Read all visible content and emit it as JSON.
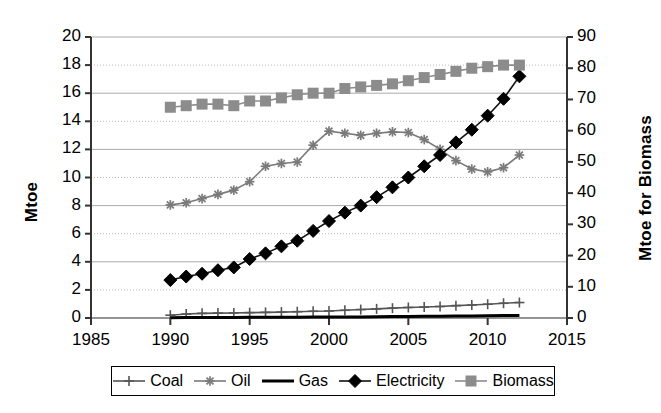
{
  "chart_data": {
    "type": "line",
    "title": "",
    "xlabel": "",
    "ylabel": "Mtoe",
    "ylabel_secondary": "Mtoe for Biomass",
    "xlim": [
      1985,
      2015
    ],
    "ylim": [
      0,
      20
    ],
    "ylim_secondary": [
      0,
      90
    ],
    "grid": true,
    "grid_style": "alternating solid and dotted horizontal gridlines",
    "legend_position": "bottom",
    "x_ticks": [
      "1985",
      "1990",
      "1995",
      "2000",
      "2005",
      "2010",
      "2015"
    ],
    "y_ticks_left": [
      "0",
      "2",
      "4",
      "6",
      "8",
      "10",
      "12",
      "14",
      "16",
      "18",
      "20"
    ],
    "y_ticks_right": [
      "0",
      "10",
      "20",
      "30",
      "40",
      "50",
      "60",
      "70",
      "80",
      "90"
    ],
    "x": [
      1990,
      1991,
      1992,
      1993,
      1994,
      1995,
      1996,
      1997,
      1998,
      1999,
      2000,
      2001,
      2002,
      2003,
      2004,
      2005,
      2006,
      2007,
      2008,
      2009,
      2010,
      2011,
      2012
    ],
    "series": [
      {
        "name": "Coal",
        "axis": "left",
        "marker": "plus",
        "color": "#555555",
        "values": [
          0.2,
          0.28,
          0.33,
          0.35,
          0.36,
          0.38,
          0.4,
          0.42,
          0.45,
          0.48,
          0.5,
          0.55,
          0.6,
          0.65,
          0.7,
          0.75,
          0.78,
          0.82,
          0.88,
          0.92,
          0.98,
          1.05,
          1.1
        ]
      },
      {
        "name": "Oil",
        "axis": "left",
        "marker": "star",
        "color": "#7a7a7a",
        "values": [
          8.05,
          8.2,
          8.5,
          8.8,
          9.1,
          9.7,
          10.8,
          11.0,
          11.1,
          12.3,
          13.3,
          13.15,
          13.0,
          13.15,
          13.25,
          13.2,
          12.7,
          12.0,
          11.2,
          10.6,
          10.4,
          10.7,
          11.6
        ]
      },
      {
        "name": "Gas",
        "axis": "left",
        "marker": "none",
        "color": "#000000",
        "values": [
          0.02,
          0.03,
          0.03,
          0.04,
          0.04,
          0.05,
          0.05,
          0.06,
          0.06,
          0.07,
          0.07,
          0.08,
          0.08,
          0.09,
          0.1,
          0.11,
          0.12,
          0.13,
          0.14,
          0.15,
          0.16,
          0.17,
          0.18
        ]
      },
      {
        "name": "Electricity",
        "axis": "left",
        "marker": "diamond",
        "color": "#000000",
        "values": [
          2.7,
          2.95,
          3.15,
          3.4,
          3.6,
          4.2,
          4.6,
          5.1,
          5.5,
          6.2,
          6.9,
          7.5,
          8.0,
          8.6,
          9.3,
          10.0,
          10.8,
          11.6,
          12.5,
          13.4,
          14.4,
          15.6,
          17.2
        ]
      },
      {
        "name": "Biomass",
        "axis": "right",
        "marker": "square",
        "color": "#8c8c8c",
        "values": [
          67.5,
          68.0,
          68.5,
          68.5,
          68.0,
          69.5,
          69.5,
          70.5,
          71.5,
          72.0,
          72.0,
          73.5,
          74.0,
          74.5,
          75.0,
          76.0,
          77.0,
          78.0,
          79.0,
          80.0,
          80.5,
          81.0,
          81.0
        ]
      }
    ]
  },
  "axes": {
    "left_title": "Mtoe",
    "right_title": "Mtoe for Biomass"
  },
  "legend": {
    "items": [
      {
        "label": "Coal",
        "marker": "plus",
        "color": "#555555"
      },
      {
        "label": "Oil",
        "marker": "star",
        "color": "#7a7a7a"
      },
      {
        "label": "Gas",
        "marker": "none",
        "color": "#000000"
      },
      {
        "label": "Electricity",
        "marker": "diamond",
        "color": "#000000"
      },
      {
        "label": "Biomass",
        "marker": "square",
        "color": "#8c8c8c"
      }
    ]
  }
}
